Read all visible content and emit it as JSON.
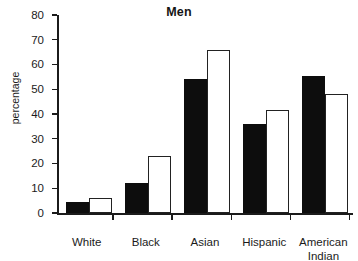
{
  "chart_data": {
    "type": "bar",
    "title": "Men",
    "xlabel": "",
    "ylabel": "percentage",
    "ylim": [
      0,
      80
    ],
    "yticks": [
      0,
      10,
      20,
      30,
      40,
      50,
      60,
      70,
      80
    ],
    "ytick_labels": [
      "0",
      "10",
      "20",
      "30",
      "40",
      "50",
      "60",
      "70",
      "80"
    ],
    "grid": false,
    "legend": null,
    "categories": [
      "White",
      "Black",
      "Asian",
      "Hispanic",
      "American Indian"
    ],
    "category_label_lines": [
      [
        "White"
      ],
      [
        "Black"
      ],
      [
        "Asian"
      ],
      [
        "Hispanic"
      ],
      [
        "American",
        "Indian"
      ]
    ],
    "series": [
      {
        "name": "series-filled",
        "style": "filled-black",
        "color": "#0d0d0d",
        "values": [
          4.5,
          12,
          54,
          36,
          55.5
        ]
      },
      {
        "name": "series-hollow",
        "style": "hollow-white",
        "color": "#ffffff",
        "values": [
          6,
          23,
          66,
          41.5,
          48
        ]
      }
    ]
  }
}
